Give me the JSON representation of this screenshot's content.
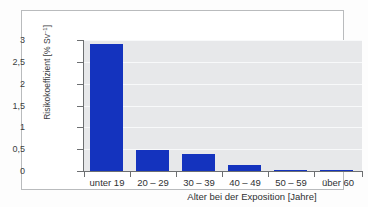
{
  "chart_data": {
    "type": "bar",
    "title": "",
    "subtitle": "",
    "categories": [
      "unter 19",
      "20 – 29",
      "30 – 39",
      "40 – 49",
      "50 – 59",
      "über 60"
    ],
    "values": [
      2.95,
      0.48,
      0.39,
      0.13,
      0.03,
      0.01
    ],
    "xlabel": "Alter bei der Exposition [Jahre]",
    "ylabel_text": "Risikokoeffizient [% Sv",
    "ylabel_exponent": "–1",
    "ylabel_tail": "]",
    "ylabel_full": "Risikokoeffizient [% Sv−1]",
    "ylim": [
      0,
      3.05
    ],
    "yticks": [
      "0",
      "0,5",
      "1",
      "1,5",
      "2",
      "2,5",
      "3"
    ],
    "ytick_values": [
      0,
      0.5,
      1,
      1.5,
      2,
      2.5,
      3
    ],
    "grid": true,
    "grid_orientation": "horizontal",
    "legend": "none",
    "bar_color": "#1433be",
    "plot_background": "#e7e8ea",
    "gridline_color": "#f8f9fa",
    "axis_color": "#6d6f71",
    "frame_color": "#b9bbbd",
    "page_background": "#ffffff"
  }
}
